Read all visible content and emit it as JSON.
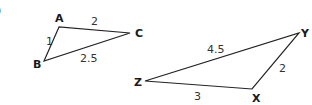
{
  "problem_marker": ")",
  "triangles": [
    {
      "name": "ABC",
      "vertices": [
        {
          "label": "A",
          "x": 59,
          "y": 27,
          "lx": 55,
          "ly": 22
        },
        {
          "label": "B",
          "x": 44,
          "y": 61,
          "lx": 33,
          "ly": 68
        },
        {
          "label": "C",
          "x": 130,
          "y": 33,
          "lx": 135,
          "ly": 37
        }
      ],
      "sides": [
        {
          "label": "1",
          "between": "AB",
          "x": 46,
          "y": 45
        },
        {
          "label": "2",
          "between": "AC",
          "x": 91,
          "y": 25
        },
        {
          "label": "2.5",
          "between": "BC",
          "x": 80,
          "y": 61
        }
      ]
    },
    {
      "name": "XYZ",
      "vertices": [
        {
          "label": "X",
          "x": 252,
          "y": 89,
          "lx": 252,
          "ly": 102
        },
        {
          "label": "Y",
          "x": 299,
          "y": 33,
          "lx": 300,
          "ly": 37
        },
        {
          "label": "Z",
          "x": 145,
          "y": 81,
          "lx": 134,
          "ly": 86
        }
      ],
      "sides": [
        {
          "label": "3",
          "between": "ZX",
          "x": 194,
          "y": 99
        },
        {
          "label": "2",
          "between": "XY",
          "x": 279,
          "y": 71
        },
        {
          "label": "4.5",
          "between": "ZY",
          "x": 208,
          "y": 52
        }
      ]
    }
  ]
}
